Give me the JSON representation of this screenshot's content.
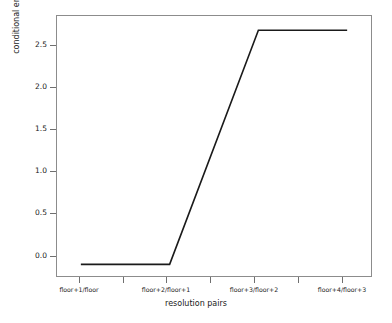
{
  "chart_data": {
    "type": "line",
    "title": "",
    "xlabel": "resolution pairs",
    "ylabel": "conditional entropy",
    "grid": false,
    "legend": null,
    "categories": [
      "floor+1/floor",
      "floor+2/floor+1",
      "floor+3/floor+2",
      "floor+4/floor+3"
    ],
    "x": [
      1,
      2,
      3,
      4
    ],
    "values": [
      0.0,
      0.0,
      2.6,
      2.6
    ],
    "series": [
      {
        "name": "conditional entropy",
        "values": [
          0.0,
          0.0,
          2.6,
          2.6
        ],
        "color": "#1a1a1a"
      }
    ],
    "xlim": [
      0.72,
      4.28
    ],
    "ylim": [
      -0.14,
      2.77
    ],
    "yticks": [
      0.0,
      0.5,
      1.0,
      1.5,
      2.0,
      2.5
    ],
    "ytick_labels": [
      "0.0",
      "0.5",
      "1.0",
      "1.5",
      "2.0",
      "2.5"
    ],
    "xticks": [
      1,
      1.5,
      2,
      2.5,
      3,
      3.5,
      4
    ],
    "xtick_labels": [
      "floor+1/floor",
      "",
      "floor+2/floor+1",
      "",
      "floor+3/floor+2",
      "",
      "floor+4/floor+3"
    ]
  },
  "axes": {
    "y": {
      "title": "conditional entropy",
      "ticks": [
        {
          "label": "2.5",
          "value": 2.5
        },
        {
          "label": "2.0",
          "value": 2.0
        },
        {
          "label": "1.5",
          "value": 1.5
        },
        {
          "label": "1.0",
          "value": 1.0
        },
        {
          "label": "0.5",
          "value": 0.5
        },
        {
          "label": "0.0",
          "value": 0.0
        }
      ]
    },
    "x": {
      "title": "resolution pairs",
      "ticks": [
        {
          "label": "floor+1/floor"
        },
        {
          "label": ""
        },
        {
          "label": "floor+2/floor+1"
        },
        {
          "label": ""
        },
        {
          "label": "floor+3/floor+2"
        },
        {
          "label": ""
        },
        {
          "label": "floor+4/floor+3"
        }
      ]
    }
  },
  "style": {
    "line_color": "#1a1a1a",
    "frame_color": "#8c8c8c",
    "tick_color": "#6f6f6f",
    "background": "#ffffff"
  }
}
